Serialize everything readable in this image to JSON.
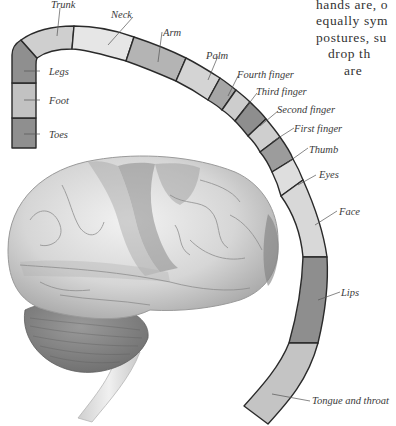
{
  "figure": {
    "segments": [
      {
        "id": "toes",
        "label": "Toes",
        "shade": "#8f8f8f"
      },
      {
        "id": "foot",
        "label": "Foot",
        "shade": "#c2c2c2"
      },
      {
        "id": "legs",
        "label": "Legs",
        "shade": "#8f8f8f"
      },
      {
        "id": "trunk",
        "label": "Trunk",
        "shade": "#cfcfcf"
      },
      {
        "id": "neck",
        "label": "Neck",
        "shade": "#e6e6e6"
      },
      {
        "id": "arm",
        "label": "Arm",
        "shade": "#b4b4b4"
      },
      {
        "id": "palm",
        "label": "Palm",
        "shade": "#d4d4d4"
      },
      {
        "id": "fourth_finger",
        "label": "Fourth finger",
        "shade": "#a6a6a6"
      },
      {
        "id": "third_finger",
        "label": "Third finger",
        "shade": "#cdcdcd"
      },
      {
        "id": "second_finger",
        "label": "Second finger",
        "shade": "#8e8e8e"
      },
      {
        "id": "first_finger",
        "label": "First finger",
        "shade": "#cfcfcf"
      },
      {
        "id": "thumb",
        "label": "Thumb",
        "shade": "#9c9c9c"
      },
      {
        "id": "eyes",
        "label": "Eyes",
        "shade": "#dedede"
      },
      {
        "id": "face",
        "label": "Face",
        "shade": "#d8d8d8"
      },
      {
        "id": "lips",
        "label": "Lips",
        "shade": "#8e8e8e"
      },
      {
        "id": "tongue_throat",
        "label": "Tongue and throat",
        "shade": "#c4c4c4"
      }
    ],
    "labels": {
      "trunk": "Trunk",
      "neck": "Neck",
      "arm": "Arm",
      "palm": "Palm",
      "legs": "Legs",
      "foot": "Foot",
      "toes": "Toes",
      "fourth_finger": "Fourth finger",
      "third_finger": "Third finger",
      "second_finger": "Second finger",
      "first_finger": "First finger",
      "thumb": "Thumb",
      "eyes": "Eyes",
      "face": "Face",
      "lips": "Lips",
      "tongue_throat": "Tongue and throat"
    },
    "brain_image": "brain-illustration-lateral-view"
  },
  "body_text": {
    "line1": "hands are, o",
    "line2": "equally sym",
    "line3": "postures, su",
    "line4": "drop th",
    "line5": "are"
  }
}
